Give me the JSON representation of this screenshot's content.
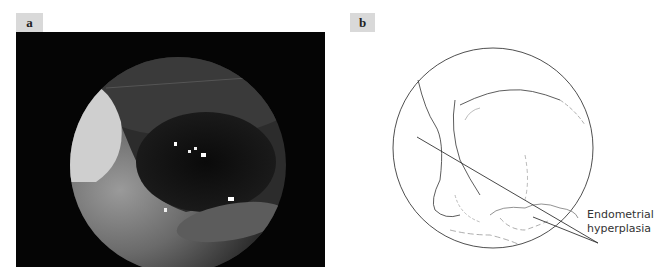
{
  "panels": [
    {
      "label": "a",
      "type": "hysteroscopic-photo",
      "description": "Grayscale endoscopic view of uterine cavity"
    },
    {
      "label": "b",
      "type": "line-drawing",
      "annotation_line1": "Endometrial",
      "annotation_line2": "hyperplasia"
    }
  ],
  "colors": {
    "label_bg": "#d9d9d9",
    "photo_bg": "#050505",
    "line": "#333333"
  }
}
